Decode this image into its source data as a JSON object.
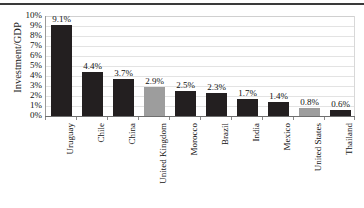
{
  "chart_data": {
    "type": "bar",
    "title": "",
    "xlabel": "",
    "ylabel": "Investment/GDP",
    "ylim": [
      0,
      10
    ],
    "ytick_labels": [
      "10%",
      "9%",
      "8%",
      "7%",
      "6%",
      "5%",
      "4%",
      "3%",
      "2%",
      "1%",
      "0%"
    ],
    "ytick_values": [
      10,
      9,
      8,
      7,
      6,
      5,
      4,
      3,
      2,
      1,
      0
    ],
    "grid": true,
    "legend": "none",
    "categories": [
      "Uruguay",
      "Chile",
      "China",
      "United Kingdom",
      "Morocco",
      "Brazil",
      "India",
      "Mexico",
      "United States",
      "Thailand"
    ],
    "values": [
      9.1,
      4.4,
      3.7,
      2.9,
      2.5,
      2.3,
      1.7,
      1.4,
      0.8,
      0.6
    ],
    "value_labels": [
      "9.1%",
      "4.4%",
      "3.7%",
      "2.9%",
      "2.5%",
      "2.3%",
      "1.7%",
      "1.4%",
      "0.8%",
      "0.6%"
    ],
    "bar_colors": [
      "#231f20",
      "#231f20",
      "#231f20",
      "#9d9d9d",
      "#231f20",
      "#231f20",
      "#231f20",
      "#231f20",
      "#9d9d9d",
      "#231f20"
    ],
    "colors": {
      "bar_dark": "#231f20",
      "bar_gray": "#9d9d9d",
      "gridline": "#e3e3e3",
      "axis": "#6e6e6e",
      "text": "#111111",
      "background": "#ffffff"
    }
  }
}
